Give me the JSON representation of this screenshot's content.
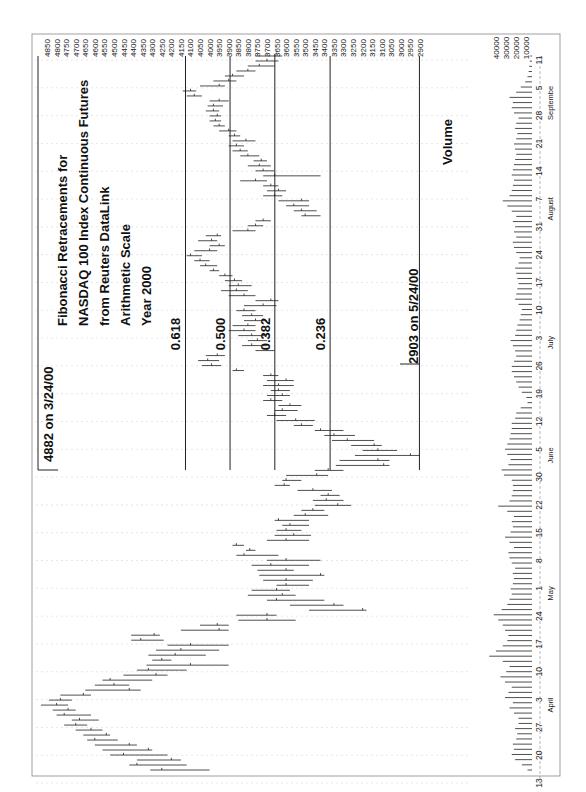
{
  "chart_data": {
    "type": "bar",
    "subtype": "ohlc-high-low-close-with-volume",
    "orientation": "rotated-90-ccw",
    "title_lines": [
      "Fibonacci Retracements for",
      "NASDAQ 100 Index Continuous Futures",
      "from Reuters DataLink",
      "Arithmetic Scale",
      "Year 2000"
    ],
    "xlabel": "",
    "ylabel": "",
    "price_axis": {
      "ticks": [
        4850,
        4800,
        4750,
        4700,
        4650,
        4600,
        4550,
        4500,
        4450,
        4400,
        4350,
        4300,
        4250,
        4200,
        4150,
        4100,
        4050,
        4000,
        3950,
        3900,
        3850,
        3800,
        3750,
        3700,
        3650,
        3600,
        3550,
        3500,
        3450,
        3400,
        3350,
        3300,
        3250,
        3200,
        3150,
        3100,
        3050,
        3000,
        2950,
        2900
      ],
      "ylim": [
        2900,
        4850
      ]
    },
    "volume_axis": {
      "ticks": [
        40000,
        30000,
        20000,
        10000
      ]
    },
    "date_axis": {
      "day_ticks": [
        "13",
        "20",
        "27",
        "3",
        "10",
        "17",
        "24",
        "1",
        "8",
        "15",
        "22",
        "30",
        "5",
        "12",
        "19",
        "26",
        "3",
        "10",
        "17",
        "24",
        "31",
        "7",
        "14",
        "21",
        "28",
        "5",
        "11"
      ],
      "months": [
        {
          "label": "April",
          "at_tick": 3
        },
        {
          "label": "May",
          "at_tick": 7
        },
        {
          "label": "June",
          "at_tick": 12
        },
        {
          "label": "July",
          "at_tick": 16
        },
        {
          "label": "August",
          "at_tick": 21
        },
        {
          "label": "Septembe",
          "at_tick": 25
        }
      ]
    },
    "annotations": {
      "high": "4882 on 3/24/00",
      "low": "2903 on 5/24/00",
      "volume_label": "Volume"
    },
    "fib_levels": [
      {
        "label": "0.618",
        "value": 4126
      },
      {
        "label": "0.500",
        "value": 3893
      },
      {
        "label": "0.382",
        "value": 3659
      },
      {
        "label": "0.236",
        "value": 3370
      }
    ],
    "high_value": 4882,
    "low_value": 2903,
    "bars": [
      [
        4310,
        4000,
        4250
      ],
      [
        4420,
        4120,
        4380
      ],
      [
        4380,
        4150,
        4200
      ],
      [
        4520,
        4220,
        4450
      ],
      [
        4560,
        4300,
        4320
      ],
      [
        4600,
        4380,
        4420
      ],
      [
        4640,
        4480,
        4600
      ],
      [
        4660,
        4520,
        4540
      ],
      [
        4700,
        4560,
        4620
      ],
      [
        4760,
        4640,
        4700
      ],
      [
        4720,
        4580,
        4680
      ],
      [
        4800,
        4620,
        4760
      ],
      [
        4820,
        4700,
        4740
      ],
      [
        4882,
        4740,
        4800
      ],
      [
        4840,
        4720,
        4780
      ],
      [
        4780,
        4620,
        4660
      ],
      [
        4650,
        4360,
        4420
      ],
      [
        4600,
        4420,
        4500
      ],
      [
        4560,
        4300,
        4520
      ],
      [
        4450,
        4220,
        4280
      ],
      [
        4380,
        4120,
        4320
      ],
      [
        4330,
        3900,
        4100
      ],
      [
        4300,
        4200,
        4250
      ],
      [
        4320,
        4020,
        4180
      ],
      [
        4280,
        3950,
        4150
      ],
      [
        4220,
        3900,
        4100
      ],
      [
        4410,
        4240,
        4360
      ],
      [
        4410,
        4260,
        4290
      ],
      [
        4150,
        3900,
        3950
      ],
      [
        4050,
        3900,
        3960
      ],
      [
        3850,
        3550,
        3700
      ],
      [
        3860,
        3650,
        3700
      ],
      [
        3480,
        3180,
        3200
      ],
      [
        3580,
        3300,
        3350
      ],
      [
        3700,
        3400,
        3650
      ],
      [
        3800,
        3550,
        3620
      ],
      [
        3780,
        3580,
        3650
      ],
      [
        3650,
        3480,
        3600
      ],
      [
        3720,
        3460,
        3600
      ],
      [
        3740,
        3400,
        3420
      ],
      [
        3750,
        3560,
        3600
      ],
      [
        3780,
        3480,
        3680
      ],
      [
        3700,
        3420,
        3600
      ],
      [
        3860,
        3640,
        3820
      ],
      [
        3810,
        3760,
        3790
      ],
      [
        3880,
        3820,
        3860
      ],
      [
        3700,
        3480,
        3600
      ],
      [
        3660,
        3470,
        3560
      ],
      [
        3650,
        3520,
        3600
      ],
      [
        3620,
        3480,
        3580
      ],
      [
        3660,
        3480,
        3640
      ],
      [
        3560,
        3380,
        3500
      ],
      [
        3520,
        3400,
        3460
      ],
      [
        3450,
        3260,
        3330
      ],
      [
        3460,
        3300,
        3390
      ],
      [
        3420,
        3320,
        3380
      ],
      [
        3540,
        3360,
        3460
      ],
      [
        3660,
        3580,
        3610
      ],
      [
        3620,
        3520,
        3600
      ],
      [
        3600,
        3380,
        3440
      ],
      [
        3450,
        3300,
        3380
      ],
      [
        3340,
        3060,
        3090
      ],
      [
        3320,
        3060,
        3120
      ],
      [
        3240,
        2903,
        2950
      ],
      [
        3200,
        3020,
        3120
      ],
      [
        3260,
        3100,
        3140
      ],
      [
        3360,
        3140,
        3280
      ],
      [
        3400,
        3240,
        3350
      ],
      [
        3450,
        3300,
        3420
      ],
      [
        3560,
        3460,
        3520
      ],
      [
        3650,
        3450,
        3550
      ],
      [
        3700,
        3600,
        3660
      ],
      [
        3660,
        3540,
        3620
      ],
      [
        3640,
        3520,
        3580
      ],
      [
        3720,
        3620,
        3680
      ],
      [
        3700,
        3580,
        3620
      ],
      [
        3680,
        3580,
        3640
      ],
      [
        3720,
        3560,
        3640
      ],
      [
        3700,
        3560,
        3600
      ],
      [
        3720,
        3640,
        3680
      ],
      [
        3880,
        3820,
        3860
      ],
      [
        4040,
        3940,
        3990
      ],
      [
        4060,
        3950,
        4010
      ],
      [
        4020,
        3920,
        3960
      ],
      [
        3760,
        3660,
        3700
      ],
      [
        3830,
        3700,
        3780
      ],
      [
        3800,
        3700,
        3750
      ],
      [
        3850,
        3700,
        3780
      ],
      [
        3900,
        3760,
        3820
      ],
      [
        3880,
        3760,
        3800
      ],
      [
        3820,
        3700,
        3760
      ],
      [
        3830,
        3720,
        3780
      ],
      [
        3860,
        3760,
        3820
      ],
      [
        3820,
        3650,
        3720
      ],
      [
        3760,
        3640,
        3680
      ],
      [
        3900,
        3760,
        3820
      ],
      [
        3940,
        3800,
        3860
      ],
      [
        3900,
        3780,
        3850
      ],
      [
        3920,
        3830,
        3870
      ],
      [
        3950,
        3880,
        3920
      ],
      [
        4000,
        3950,
        3980
      ],
      [
        4050,
        3960,
        4020
      ],
      [
        4080,
        4000,
        4050
      ],
      [
        4120,
        4040,
        4100
      ],
      [
        4080,
        3960,
        4000
      ],
      [
        4000,
        3920,
        3950
      ],
      [
        4060,
        3960,
        3990
      ],
      [
        4020,
        3940,
        3960
      ],
      [
        3880,
        3760,
        3800
      ],
      [
        3800,
        3720,
        3760
      ],
      [
        3760,
        3680,
        3720
      ],
      [
        3520,
        3420,
        3500
      ],
      [
        3560,
        3440,
        3520
      ],
      [
        3600,
        3480,
        3560
      ],
      [
        3640,
        3480,
        3520
      ],
      [
        3720,
        3620,
        3660
      ],
      [
        3700,
        3600,
        3640
      ],
      [
        3720,
        3640,
        3680
      ],
      [
        3840,
        3700,
        3760
      ],
      [
        3720,
        3420,
        3660
      ],
      [
        3760,
        3660,
        3720
      ],
      [
        3800,
        3680,
        3740
      ],
      [
        3770,
        3700,
        3730
      ],
      [
        3840,
        3740,
        3800
      ],
      [
        3880,
        3800,
        3840
      ],
      [
        3900,
        3820,
        3860
      ],
      [
        3880,
        3760,
        3810
      ],
      [
        3900,
        3840,
        3870
      ],
      [
        3950,
        3860,
        3900
      ],
      [
        3980,
        3920,
        3950
      ],
      [
        4000,
        3940,
        3970
      ],
      [
        4000,
        3940,
        3960
      ],
      [
        4020,
        3950,
        3980
      ],
      [
        4010,
        3930,
        3980
      ],
      [
        4000,
        3900,
        3950
      ],
      [
        4120,
        4040,
        4080
      ],
      [
        4140,
        4070,
        4100
      ],
      [
        4050,
        3920,
        3950
      ],
      [
        3980,
        3860,
        3900
      ],
      [
        3920,
        3820,
        3880
      ],
      [
        3860,
        3760,
        3800
      ],
      [
        3800,
        3660,
        3740
      ],
      [
        3760,
        3640,
        3700
      ],
      [
        3760,
        3620,
        3660
      ]
    ],
    "volume": [
      4000,
      9000,
      15000,
      18000,
      16000,
      17000,
      14000,
      13000,
      15000,
      12000,
      12000,
      16000,
      20000,
      17000,
      24000,
      21000,
      18000,
      24000,
      28000,
      23000,
      20000,
      26000,
      38000,
      32000,
      26000,
      22000,
      21000,
      24000,
      26000,
      30000,
      34000,
      27000,
      22000,
      20000,
      18000,
      19000,
      17000,
      16000,
      17000,
      15000,
      18000,
      20000,
      21000,
      16000,
      20000,
      24000,
      19000,
      17000,
      18000,
      16000,
      22000,
      30000,
      20000,
      18000,
      17000,
      17000,
      18000,
      25000,
      27000,
      21000,
      19000,
      22000,
      24000,
      22000,
      20000,
      19000,
      18000,
      18000,
      15000,
      14000,
      10000,
      4000,
      5000,
      9000,
      12000,
      14000,
      16000,
      18000,
      18000,
      16000,
      14000,
      15000,
      17000,
      19000,
      15000,
      14000,
      13000,
      11000,
      10000,
      9000,
      12000,
      15000,
      14000,
      13000,
      12000,
      13000,
      14000,
      15000,
      12000,
      11000,
      14000,
      16000,
      17000,
      14000,
      16000,
      15000,
      17000,
      14000,
      18000,
      22000,
      26000,
      20000,
      18000,
      17000,
      16000,
      18000,
      17000,
      16000,
      15000,
      14000,
      15000,
      16000,
      14000,
      13000,
      15000,
      14000,
      12000,
      16000,
      18000,
      17000,
      20000,
      14000,
      10000,
      6000,
      4000,
      3000,
      2500,
      2000,
      1500
    ]
  }
}
